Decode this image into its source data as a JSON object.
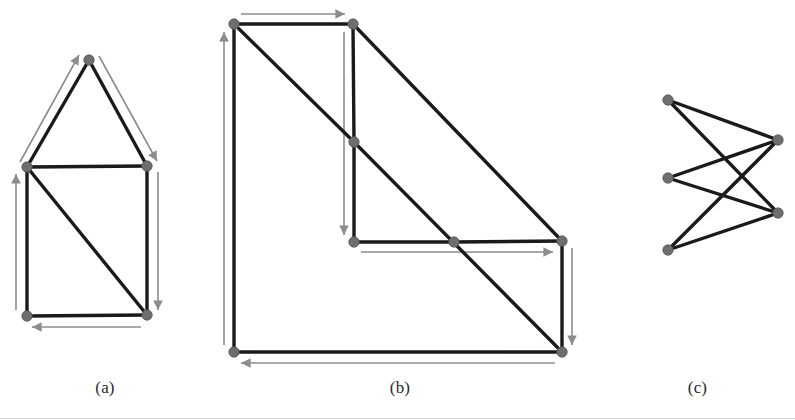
{
  "page": {
    "width": 795,
    "height": 420,
    "background": "#ffffff",
    "edge_color": "#1a1a1a",
    "node_color": "#6e6e6e",
    "node_stroke": "#555555",
    "arrow_color": "#8c8c8c",
    "caption_color": "#2b2b2b"
  },
  "figures": [
    {
      "id": "a",
      "caption": "(a)",
      "description": "triangle stacked on a square with one diagonal, traversal arrows along the outer boundary",
      "nodes": [
        {
          "name": "apex",
          "x": 89,
          "y": 60
        },
        {
          "name": "mid-left",
          "x": 27,
          "y": 167
        },
        {
          "name": "mid-right",
          "x": 147,
          "y": 166
        },
        {
          "name": "bottom-left",
          "x": 27,
          "y": 316
        },
        {
          "name": "bottom-right",
          "x": 147,
          "y": 315
        }
      ],
      "edges": [
        {
          "from": "mid-left",
          "to": "apex"
        },
        {
          "from": "apex",
          "to": "mid-right"
        },
        {
          "from": "mid-left",
          "to": "mid-right"
        },
        {
          "from": "mid-left",
          "to": "bottom-left"
        },
        {
          "from": "mid-right",
          "to": "bottom-right"
        },
        {
          "from": "bottom-left",
          "to": "bottom-right"
        },
        {
          "from": "mid-left",
          "to": "bottom-right"
        }
      ],
      "arrows": [
        {
          "name": "arrow-up-left-slope",
          "x1": 20,
          "y1": 162,
          "x2": 79,
          "y2": 55
        },
        {
          "name": "arrow-down-right-slope",
          "x1": 99,
          "y1": 56,
          "x2": 157,
          "y2": 161
        },
        {
          "name": "arrow-down-right-side",
          "x1": 158,
          "y1": 172,
          "x2": 158,
          "y2": 310
        },
        {
          "name": "arrow-left-bottom",
          "x1": 141,
          "y1": 327,
          "x2": 32,
          "y2": 327
        },
        {
          "name": "arrow-up-left-side",
          "x1": 16,
          "y1": 310,
          "x2": 16,
          "y2": 174
        }
      ]
    },
    {
      "id": "b",
      "caption": "(b)",
      "description": "L-shaped staircase polygon triangulated with two long diagonals, traversal arrows along the boundary",
      "nodes": [
        {
          "name": "top-left",
          "x": 234,
          "y": 24
        },
        {
          "name": "top-right",
          "x": 353,
          "y": 24
        },
        {
          "name": "notch",
          "x": 354,
          "y": 142
        },
        {
          "name": "inner-corner",
          "x": 354,
          "y": 242
        },
        {
          "name": "mid-edge",
          "x": 454,
          "y": 242
        },
        {
          "name": "right-upper",
          "x": 562,
          "y": 241
        },
        {
          "name": "right-lower",
          "x": 562,
          "y": 352
        },
        {
          "name": "bottom-left",
          "x": 234,
          "y": 352
        }
      ],
      "edges": [
        {
          "from": "top-left",
          "to": "top-right"
        },
        {
          "from": "top-right",
          "to": "notch"
        },
        {
          "from": "notch",
          "to": "inner-corner"
        },
        {
          "from": "inner-corner",
          "to": "mid-edge"
        },
        {
          "from": "mid-edge",
          "to": "right-upper"
        },
        {
          "from": "right-upper",
          "to": "right-lower"
        },
        {
          "from": "right-lower",
          "to": "bottom-left"
        },
        {
          "from": "bottom-left",
          "to": "top-left"
        },
        {
          "from": "top-left",
          "to": "notch"
        },
        {
          "from": "notch",
          "to": "right-lower"
        },
        {
          "from": "top-right",
          "to": "right-upper"
        }
      ],
      "arrows": [
        {
          "name": "arrow-right-top",
          "x1": 241,
          "y1": 14,
          "x2": 345,
          "y2": 14
        },
        {
          "name": "arrow-down-notch",
          "x1": 344,
          "y1": 32,
          "x2": 344,
          "y2": 235
        },
        {
          "name": "arrow-right-middle",
          "x1": 361,
          "y1": 252,
          "x2": 553,
          "y2": 252
        },
        {
          "name": "arrow-down-right",
          "x1": 572,
          "y1": 248,
          "x2": 572,
          "y2": 345
        },
        {
          "name": "arrow-left-bottom",
          "x1": 555,
          "y1": 363,
          "x2": 241,
          "y2": 363
        },
        {
          "name": "arrow-up-left",
          "x1": 224,
          "y1": 345,
          "x2": 224,
          "y2": 32
        }
      ]
    },
    {
      "id": "c",
      "caption": "(c)",
      "description": "bipartite-style graph, three nodes on the left and two on the right with six crossing edges",
      "nodes": [
        {
          "name": "left-top",
          "x": 668,
          "y": 100
        },
        {
          "name": "left-middle",
          "x": 668,
          "y": 178
        },
        {
          "name": "left-bottom",
          "x": 668,
          "y": 250
        },
        {
          "name": "right-upper",
          "x": 778,
          "y": 140
        },
        {
          "name": "right-lower",
          "x": 778,
          "y": 213
        }
      ],
      "edges": [
        {
          "from": "left-top",
          "to": "right-upper"
        },
        {
          "from": "left-top",
          "to": "right-lower"
        },
        {
          "from": "left-middle",
          "to": "right-upper"
        },
        {
          "from": "left-middle",
          "to": "right-lower"
        },
        {
          "from": "left-bottom",
          "to": "right-upper"
        },
        {
          "from": "left-bottom",
          "to": "right-lower"
        }
      ],
      "arrows": []
    }
  ]
}
